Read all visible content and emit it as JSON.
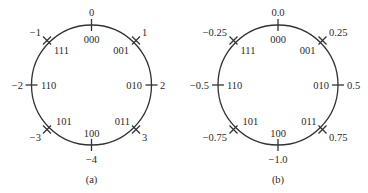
{
  "diagrams": [
    {
      "caption": "(a)",
      "center": [
        91.5,
        85
      ],
      "radius": 60,
      "points": [
        {
          "angle_deg": 90,
          "code": "000",
          "value": "0"
        },
        {
          "angle_deg": 45,
          "code": "001",
          "value": "1"
        },
        {
          "angle_deg": 0,
          "code": "010",
          "value": "2"
        },
        {
          "angle_deg": -45,
          "code": "011",
          "value": "3"
        },
        {
          "angle_deg": -90,
          "code": "100",
          "value": "−4"
        },
        {
          "angle_deg": -135,
          "code": "101",
          "value": "−3"
        },
        {
          "angle_deg": 180,
          "code": "110",
          "value": "−2"
        },
        {
          "angle_deg": 135,
          "code": "111",
          "value": "−1"
        }
      ]
    },
    {
      "caption": "(b)",
      "center": [
        278,
        85
      ],
      "radius": 60,
      "points": [
        {
          "angle_deg": 90,
          "code": "000",
          "value": "0.0"
        },
        {
          "angle_deg": 45,
          "code": "001",
          "value": "0.25"
        },
        {
          "angle_deg": 0,
          "code": "010",
          "value": "0.5"
        },
        {
          "angle_deg": -45,
          "code": "011",
          "value": "0.75"
        },
        {
          "angle_deg": -90,
          "code": "100",
          "value": "−1.0"
        },
        {
          "angle_deg": -135,
          "code": "101",
          "value": "−0.75"
        },
        {
          "angle_deg": 180,
          "code": "110",
          "value": "−0.5"
        },
        {
          "angle_deg": 135,
          "code": "111",
          "value": "−0.25"
        }
      ]
    }
  ],
  "colors": {
    "stroke": "#333333",
    "text": "#2a2a2a",
    "background": "#ffffff"
  }
}
